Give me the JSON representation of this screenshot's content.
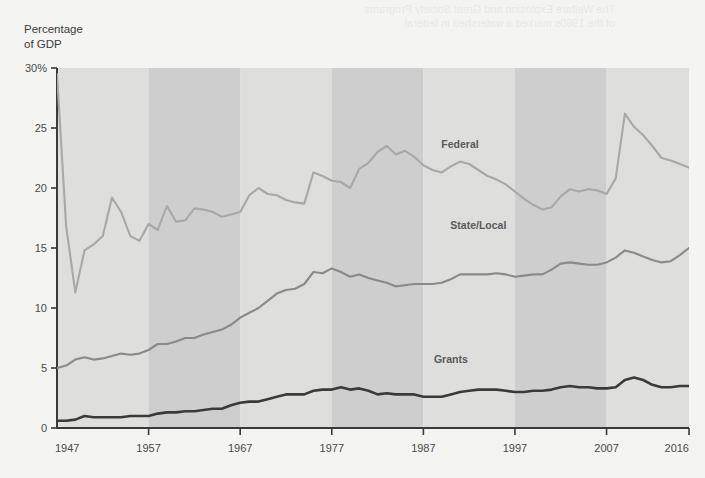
{
  "page": {
    "background_color": "#f4f4f2",
    "bleed_through_text": "The Welfare Explosion and Great Society Programs\nof the 1960s marked a watershed in federal"
  },
  "axis_title": "Percentage\nof GDP",
  "chart_data": {
    "type": "line",
    "title": "",
    "xlabel": "",
    "ylabel": "Percentage of GDP",
    "xlim": [
      1947,
      2016
    ],
    "ylim": [
      0,
      30
    ],
    "yticks": [
      0,
      5,
      10,
      15,
      20,
      25,
      30
    ],
    "ytick_labels": [
      "0",
      "5",
      "10",
      "15",
      "20",
      "25",
      "30%"
    ],
    "xticks": [
      1947,
      1957,
      1967,
      1977,
      1987,
      1997,
      2007,
      2016
    ],
    "xtick_labels": [
      "1947",
      "1957",
      "1967",
      "1977",
      "1987",
      "1997",
      "2007",
      "2016"
    ],
    "grid": false,
    "legend_position": "inline-labels",
    "decade_bands": [
      {
        "start": 1947,
        "end": 1957,
        "shade": "light"
      },
      {
        "start": 1957,
        "end": 1967,
        "shade": "dark"
      },
      {
        "start": 1967,
        "end": 1977,
        "shade": "light"
      },
      {
        "start": 1977,
        "end": 1987,
        "shade": "dark"
      },
      {
        "start": 1987,
        "end": 1997,
        "shade": "light"
      },
      {
        "start": 1997,
        "end": 2007,
        "shade": "dark"
      },
      {
        "start": 2007,
        "end": 2016,
        "shade": "light"
      }
    ],
    "band_colors": {
      "light": "#dededc",
      "dark": "#cecece"
    },
    "x": [
      1947,
      1948,
      1949,
      1950,
      1951,
      1952,
      1953,
      1954,
      1955,
      1956,
      1957,
      1958,
      1959,
      1960,
      1961,
      1962,
      1963,
      1964,
      1965,
      1966,
      1967,
      1968,
      1969,
      1970,
      1971,
      1972,
      1973,
      1974,
      1975,
      1976,
      1977,
      1978,
      1979,
      1980,
      1981,
      1982,
      1983,
      1984,
      1985,
      1986,
      1987,
      1988,
      1989,
      1990,
      1991,
      1992,
      1993,
      1994,
      1995,
      1996,
      1997,
      1998,
      1999,
      2000,
      2001,
      2002,
      2003,
      2004,
      2005,
      2006,
      2007,
      2008,
      2009,
      2010,
      2011,
      2012,
      2013,
      2014,
      2015,
      2016
    ],
    "series": [
      {
        "name": "Federal",
        "color": "#a8a8a8",
        "label_color": "#7a7a7a",
        "values": [
          29.5,
          16.8,
          11.3,
          14.8,
          15.3,
          16.0,
          19.2,
          18.0,
          16.0,
          15.6,
          17.0,
          16.5,
          18.5,
          17.2,
          17.3,
          18.3,
          18.2,
          18.0,
          17.6,
          17.8,
          18.0,
          19.4,
          20.0,
          19.5,
          19.4,
          19.0,
          18.8,
          18.7,
          21.3,
          21.0,
          20.6,
          20.5,
          20.0,
          21.6,
          22.1,
          23.0,
          23.5,
          22.8,
          23.1,
          22.6,
          21.9,
          21.5,
          21.3,
          21.8,
          22.2,
          22.0,
          21.5,
          21.0,
          20.7,
          20.3,
          19.7,
          19.1,
          18.6,
          18.2,
          18.4,
          19.3,
          19.9,
          19.7,
          19.9,
          19.8,
          19.5,
          20.8,
          26.2,
          25.1,
          24.4,
          23.5,
          22.5,
          22.3,
          22.0,
          21.7
        ]
      },
      {
        "name": "State/Local",
        "color": "#8a8a8a",
        "label_color": "#3a3a3a",
        "values": [
          5.0,
          5.2,
          5.7,
          5.9,
          5.7,
          5.8,
          6.0,
          6.2,
          6.1,
          6.2,
          6.5,
          7.0,
          7.0,
          7.2,
          7.5,
          7.5,
          7.8,
          8.0,
          8.2,
          8.6,
          9.2,
          9.6,
          10.0,
          10.6,
          11.2,
          11.5,
          11.6,
          12.0,
          13.0,
          12.9,
          13.3,
          13.0,
          12.6,
          12.8,
          12.5,
          12.3,
          12.1,
          11.8,
          11.9,
          12.0,
          12.0,
          12.0,
          12.1,
          12.4,
          12.8,
          12.8,
          12.8,
          12.8,
          12.9,
          12.8,
          12.6,
          12.7,
          12.8,
          12.8,
          13.2,
          13.7,
          13.8,
          13.7,
          13.6,
          13.6,
          13.8,
          14.2,
          14.8,
          14.6,
          14.3,
          14.0,
          13.8,
          13.9,
          14.4,
          15.0
        ]
      },
      {
        "name": "Grants",
        "color": "#3a3a3a",
        "label_color": "#2a2a2a",
        "values": [
          0.6,
          0.6,
          0.7,
          1.0,
          0.9,
          0.9,
          0.9,
          0.9,
          1.0,
          1.0,
          1.0,
          1.2,
          1.3,
          1.3,
          1.4,
          1.4,
          1.5,
          1.6,
          1.6,
          1.9,
          2.1,
          2.2,
          2.2,
          2.4,
          2.6,
          2.8,
          2.8,
          2.8,
          3.1,
          3.2,
          3.2,
          3.4,
          3.2,
          3.3,
          3.1,
          2.8,
          2.9,
          2.8,
          2.8,
          2.8,
          2.6,
          2.6,
          2.6,
          2.8,
          3.0,
          3.1,
          3.2,
          3.2,
          3.2,
          3.1,
          3.0,
          3.0,
          3.1,
          3.1,
          3.2,
          3.4,
          3.5,
          3.4,
          3.4,
          3.3,
          3.3,
          3.4,
          4.0,
          4.2,
          4.0,
          3.6,
          3.4,
          3.4,
          3.5,
          3.5
        ]
      }
    ],
    "annotations": [
      {
        "text": "Federal",
        "x": 1991,
        "y": 23.3
      },
      {
        "text": "State/Local",
        "x": 1993,
        "y": 16.6
      },
      {
        "text": "Grants",
        "x": 1990,
        "y": 5.4
      }
    ]
  }
}
